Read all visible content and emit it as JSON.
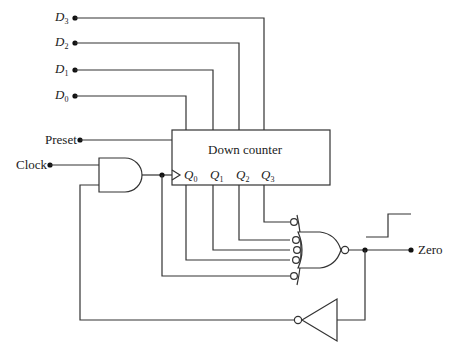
{
  "inputs": {
    "d3": {
      "name": "D",
      "sub": "3"
    },
    "d2": {
      "name": "D",
      "sub": "2"
    },
    "d1": {
      "name": "D",
      "sub": "1"
    },
    "d0": {
      "name": "D",
      "sub": "0"
    },
    "preset": "Preset",
    "clock": "Clock"
  },
  "counter": {
    "title": "Down counter",
    "outputs": [
      {
        "name": "Q",
        "sub": "0"
      },
      {
        "name": "Q",
        "sub": "1"
      },
      {
        "name": "Q",
        "sub": "2"
      },
      {
        "name": "Q",
        "sub": "3"
      }
    ]
  },
  "output": {
    "label": "Zero"
  },
  "gates": [
    "AND",
    "NOR (5 inverted inputs)",
    "NOT (inverter)"
  ]
}
